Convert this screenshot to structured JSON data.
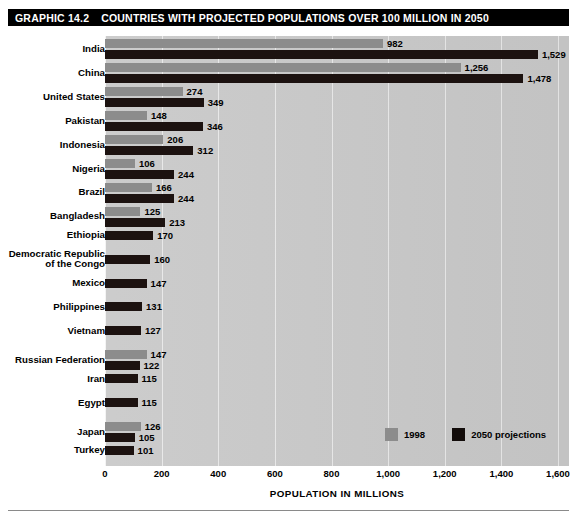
{
  "header": {
    "graphic_number": "GRAPHIC 14.2",
    "title": "COUNTRIES WITH PROJECTED POPULATIONS OVER 100 MILLION IN 2050"
  },
  "legend": {
    "position": "bottom-right",
    "items": [
      {
        "label": "1998",
        "color": "#8c8c8c",
        "swatch_name": "legend-swatch-1998"
      },
      {
        "label": "2050 projections",
        "color": "#120c0a",
        "swatch_name": "legend-swatch-2050"
      }
    ]
  },
  "axis": {
    "xlabel": "POPULATION IN MILLIONS",
    "ticks": [
      "0",
      "200",
      "400",
      "600",
      "800",
      "1,000",
      "1,200",
      "1,400",
      "1,600"
    ]
  },
  "chart_data": {
    "type": "bar",
    "orientation": "horizontal",
    "title": "COUNTRIES WITH PROJECTED POPULATIONS OVER 100 MILLION IN 2050",
    "subtitle": "GRAPHIC 14.2",
    "xlabel": "POPULATION IN MILLIONS",
    "ylabel": "",
    "xlim": [
      0,
      1600
    ],
    "xticks": [
      0,
      200,
      400,
      600,
      800,
      1000,
      1200,
      1400,
      1600
    ],
    "grid": "vertical",
    "legend_position": "bottom-right",
    "categories": [
      "India",
      "China",
      "United States",
      "Pakistan",
      "Indonesia",
      "Nigeria",
      "Brazil",
      "Bangladesh",
      "Ethiopia",
      "Democratic Republic\nof the Congo",
      "Mexico",
      "Philippines",
      "Vietnam",
      "Russian Federation",
      "Iran",
      "Egypt",
      "Japan",
      "Turkey"
    ],
    "series": [
      {
        "name": "1998",
        "color": "#8c8c8c",
        "values": [
          982,
          1256,
          274,
          148,
          206,
          106,
          166,
          125,
          null,
          null,
          null,
          null,
          null,
          147,
          null,
          null,
          126,
          null
        ],
        "labels": [
          "982",
          "1,256",
          "274",
          "148",
          "206",
          "106",
          "166",
          "125",
          "",
          "",
          "",
          "",
          "",
          "147",
          "",
          "",
          "126",
          ""
        ]
      },
      {
        "name": "2050 projections",
        "color": "#120c0a",
        "values": [
          1529,
          1478,
          349,
          346,
          312,
          244,
          244,
          213,
          170,
          160,
          147,
          131,
          127,
          122,
          115,
          115,
          105,
          101
        ],
        "labels": [
          "1,529",
          "1,478",
          "349",
          "346",
          "312",
          "244",
          "244",
          "213",
          "170",
          "160",
          "147",
          "131",
          "127",
          "122",
          "115",
          "115",
          "105",
          "101"
        ]
      }
    ]
  }
}
